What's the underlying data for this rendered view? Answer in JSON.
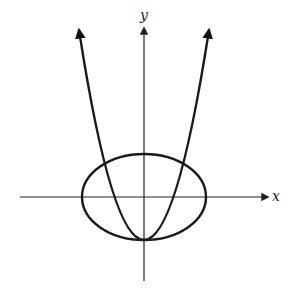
{
  "diagram": {
    "axes": {
      "x_label": "x",
      "y_label": "y",
      "color": "#222222"
    },
    "curves": [
      {
        "name": "parabola",
        "shape": "upward-opening parabola with arrowheads",
        "vertex": "on negative y-axis at bottom of ellipse"
      },
      {
        "name": "ellipse",
        "shape": "horizontal ellipse centered at origin"
      }
    ],
    "stroke_color": "#1a1a1a"
  }
}
